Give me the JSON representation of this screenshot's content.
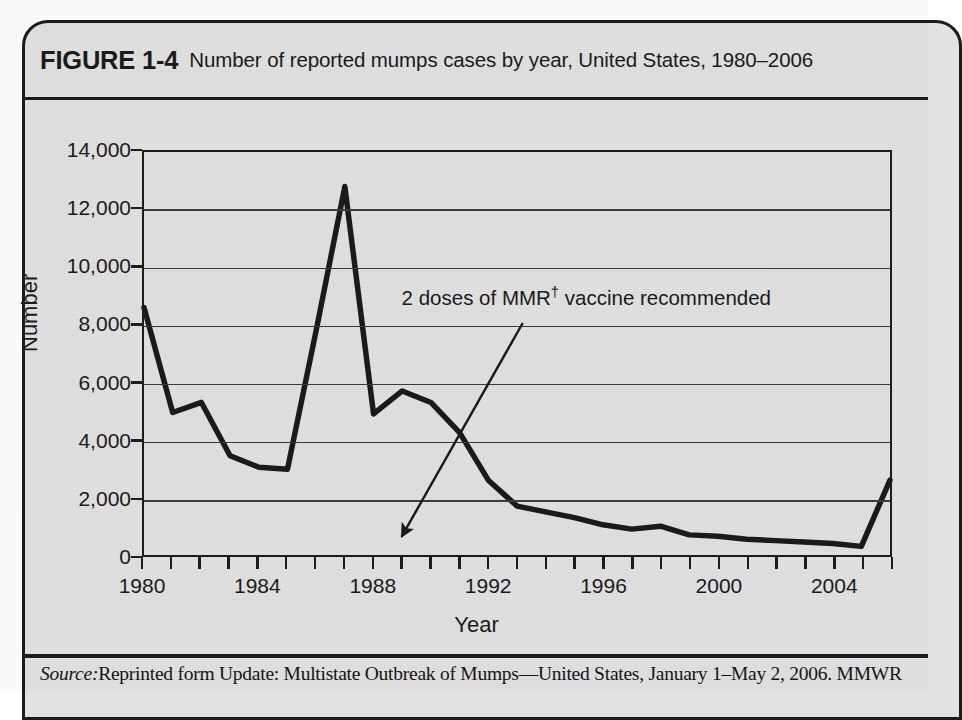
{
  "figure": {
    "label": "FIGURE 1-4",
    "caption": "Number of reported mumps cases by year, United States, 1980–2006",
    "source_prefix": "Source:",
    "source_text": "Reprinted form Update: Multistate Outbreak of Mumps—United States, January 1–May 2, 2006. MMWR"
  },
  "colors": {
    "card_bg": "#e2e2e2",
    "frame": "#1c1c1c",
    "gridline": "#3a3a3a",
    "series": "#1a1a1a"
  },
  "chart_data": {
    "type": "line",
    "title": "Number of reported mumps cases by year, United States, 1980–2006",
    "xlabel": "Year",
    "ylabel": "Number",
    "xlim": [
      1980,
      2006
    ],
    "ylim": [
      0,
      14000
    ],
    "grid": true,
    "legend": "none",
    "ytick_labels": [
      "14,000",
      "12,000",
      "10,000",
      "8,000",
      "6,000",
      "4,000",
      "2,000",
      "0"
    ],
    "yticks": [
      14000,
      12000,
      10000,
      8000,
      6000,
      4000,
      2000,
      0
    ],
    "xtick_labels": [
      "1980",
      "1984",
      "1988",
      "1992",
      "1996",
      "2000",
      "2004"
    ],
    "xticks_major": [
      1980,
      1984,
      1988,
      1992,
      1996,
      2000,
      2004
    ],
    "xticks_minor_step": 1,
    "x": [
      1980,
      1981,
      1982,
      1983,
      1984,
      1985,
      1986,
      1987,
      1988,
      1989,
      1990,
      1991,
      1992,
      1993,
      1994,
      1995,
      1996,
      1997,
      1998,
      1999,
      2000,
      2001,
      2002,
      2003,
      2004,
      2005,
      2006
    ],
    "series": [
      {
        "name": "Reported mumps cases",
        "values": [
          8600,
          4950,
          5300,
          3450,
          3050,
          2980,
          7800,
          12800,
          4900,
          5700,
          5300,
          4250,
          2600,
          1700,
          1500,
          1300,
          1050,
          900,
          1000,
          700,
          650,
          550,
          500,
          450,
          400,
          300,
          2600
        ]
      }
    ],
    "annotations": [
      {
        "name": "mmr-annotation",
        "text": "2 doses of MMR† vaccine recommended",
        "text_plain": "2 doses of MMR",
        "superscript": "†",
        "text_tail": " vaccine recommended",
        "arrow_from": [
          1993.2,
          8050
        ],
        "arrow_to": [
          1989.0,
          700
        ]
      }
    ]
  }
}
